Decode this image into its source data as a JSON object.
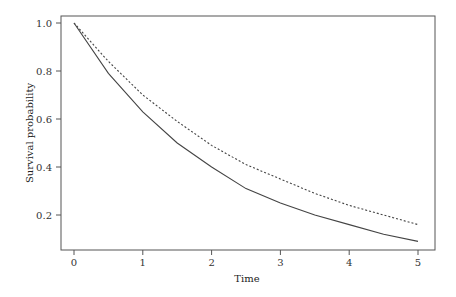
{
  "chart_data": {
    "type": "line",
    "title": "",
    "xlabel": "Time",
    "ylabel": "Survival probability",
    "xlim": [
      -0.2,
      5.2
    ],
    "ylim": [
      0.07,
      1.03
    ],
    "x_ticks": [
      "0",
      "1",
      "2",
      "3",
      "4",
      "5"
    ],
    "y_ticks": [
      "0.2",
      "0.4",
      "0.6",
      "0.8",
      "1.0"
    ],
    "grid": false,
    "legend": "none",
    "x": [
      0,
      0.5,
      1,
      1.5,
      2,
      2.5,
      3,
      3.5,
      4,
      4.5,
      5
    ],
    "series": [
      {
        "name": "solid",
        "style": "solid",
        "values": [
          1.0,
          0.79,
          0.63,
          0.5,
          0.4,
          0.31,
          0.25,
          0.2,
          0.16,
          0.12,
          0.09
        ]
      },
      {
        "name": "dotted",
        "style": "dotted",
        "values": [
          1.0,
          0.84,
          0.7,
          0.59,
          0.49,
          0.41,
          0.35,
          0.29,
          0.24,
          0.2,
          0.16
        ]
      }
    ]
  },
  "labels": {
    "xlabel": "Time",
    "ylabel": "Survival probability"
  }
}
